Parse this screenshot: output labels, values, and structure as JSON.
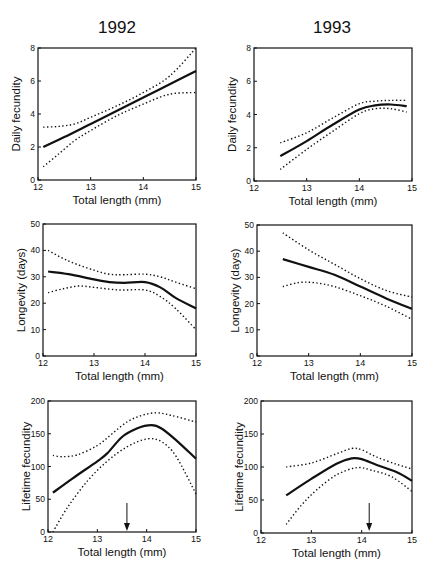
{
  "figure": {
    "column_titles": [
      "1992",
      "1993"
    ],
    "colors": {
      "line": "#111111",
      "background": "#ffffff"
    }
  },
  "chart_data": [
    {
      "id": "daily-fecundity-1992",
      "type": "line",
      "title": "1992",
      "xlabel": "Total length (mm)",
      "ylabel": "Daily fecundity",
      "xlim": [
        12,
        15
      ],
      "ylim": [
        0,
        8
      ],
      "xticks": [
        12,
        13,
        14,
        15
      ],
      "yticks": [
        0,
        2,
        4,
        6,
        8
      ],
      "grid": false,
      "box": {
        "left": 38,
        "top": 48,
        "right": 196,
        "bottom": 180
      },
      "series": [
        {
          "name": "fit",
          "style": "solid",
          "x": [
            12.1,
            12.5,
            13,
            13.5,
            14,
            14.5,
            15
          ],
          "y": [
            2.0,
            2.6,
            3.4,
            4.2,
            5.0,
            5.8,
            6.6
          ]
        },
        {
          "name": "upper CI",
          "style": "dotted",
          "x": [
            12.1,
            12.4,
            12.7,
            13,
            13.5,
            14,
            14.5,
            15
          ],
          "y": [
            3.2,
            3.25,
            3.4,
            3.8,
            4.5,
            5.3,
            6.3,
            8.0
          ]
        },
        {
          "name": "lower CI",
          "style": "dotted",
          "x": [
            12.1,
            12.4,
            12.7,
            13,
            13.5,
            14,
            14.5,
            15
          ],
          "y": [
            0.8,
            1.6,
            2.4,
            3.0,
            3.9,
            4.6,
            5.2,
            5.3
          ]
        }
      ]
    },
    {
      "id": "daily-fecundity-1993",
      "type": "line",
      "title": "1993",
      "xlabel": "Total length (mm)",
      "ylabel": "Daily fecundity",
      "xlim": [
        12,
        15
      ],
      "ylim": [
        0,
        8
      ],
      "xticks": [
        12,
        13,
        14,
        15
      ],
      "yticks": [
        0,
        2,
        4,
        6,
        8
      ],
      "grid": false,
      "box": {
        "left": 254,
        "top": 48,
        "right": 412,
        "bottom": 181
      },
      "series": [
        {
          "name": "fit",
          "style": "solid",
          "x": [
            12.5,
            13,
            13.5,
            14,
            14.3,
            14.6,
            14.9
          ],
          "y": [
            1.5,
            2.4,
            3.4,
            4.3,
            4.55,
            4.6,
            4.5
          ]
        },
        {
          "name": "upper CI",
          "style": "dotted",
          "x": [
            12.5,
            13,
            13.5,
            14,
            14.3,
            14.6,
            14.9
          ],
          "y": [
            2.3,
            2.9,
            3.8,
            4.65,
            4.8,
            4.85,
            4.85
          ]
        },
        {
          "name": "lower CI",
          "style": "dotted",
          "x": [
            12.5,
            13,
            13.5,
            14,
            14.3,
            14.6,
            14.9
          ],
          "y": [
            0.7,
            1.9,
            3.0,
            4.05,
            4.35,
            4.35,
            4.15
          ]
        }
      ]
    },
    {
      "id": "longevity-1992",
      "type": "line",
      "title": "",
      "xlabel": "Total length (mm)",
      "ylabel": "Longevity (days)",
      "xlim": [
        12,
        15
      ],
      "ylim": [
        0,
        50
      ],
      "xticks": [
        12,
        13,
        14,
        15
      ],
      "yticks": [
        0,
        10,
        20,
        30,
        40,
        50
      ],
      "grid": false,
      "box": {
        "left": 43,
        "top": 224,
        "right": 196,
        "bottom": 356
      },
      "series": [
        {
          "name": "fit",
          "style": "solid",
          "x": [
            12.1,
            12.5,
            13,
            13.3,
            13.6,
            14,
            14.3,
            14.6,
            15
          ],
          "y": [
            32,
            31,
            29,
            28,
            27.7,
            28,
            26,
            22,
            18
          ]
        },
        {
          "name": "upper CI",
          "style": "dotted",
          "x": [
            12.1,
            12.5,
            13,
            13.3,
            13.6,
            14,
            14.3,
            14.6,
            15
          ],
          "y": [
            40,
            36,
            32.5,
            31,
            30.8,
            31,
            30,
            28,
            25.5
          ]
        },
        {
          "name": "lower CI",
          "style": "dotted",
          "x": [
            12.1,
            12.4,
            12.7,
            13,
            13.5,
            14,
            14.3,
            14.6,
            15
          ],
          "y": [
            24,
            25.5,
            26.5,
            26,
            25,
            25,
            22.5,
            18,
            10
          ]
        }
      ]
    },
    {
      "id": "longevity-1993",
      "type": "line",
      "title": "",
      "xlabel": "Total length (mm)",
      "ylabel": "Longevity (days)",
      "xlim": [
        12,
        15
      ],
      "ylim": [
        0,
        50
      ],
      "xticks": [
        12,
        13,
        14,
        15
      ],
      "yticks": [
        0,
        10,
        20,
        30,
        40,
        50
      ],
      "grid": false,
      "box": {
        "left": 257,
        "top": 225,
        "right": 412,
        "bottom": 356
      },
      "series": [
        {
          "name": "fit",
          "style": "solid",
          "x": [
            12.5,
            13,
            13.5,
            14,
            14.5,
            15
          ],
          "y": [
            37,
            34,
            31,
            26.5,
            22,
            18
          ]
        },
        {
          "name": "upper CI",
          "style": "dotted",
          "x": [
            12.5,
            13,
            13.5,
            14,
            14.5,
            15
          ],
          "y": [
            47,
            40.5,
            35,
            29.5,
            25,
            22.5
          ]
        },
        {
          "name": "lower CI",
          "style": "dotted",
          "x": [
            12.5,
            12.8,
            13.1,
            13.5,
            14,
            14.5,
            15
          ],
          "y": [
            26.5,
            28,
            28,
            26.5,
            23,
            19,
            14
          ]
        }
      ]
    },
    {
      "id": "lifetime-fecundity-1992",
      "type": "line",
      "title": "",
      "xlabel": "Total length (mm)",
      "ylabel": "Lifetime fecundity",
      "xlim": [
        12,
        15
      ],
      "ylim": [
        0,
        200
      ],
      "xticks": [
        12,
        13,
        14,
        15
      ],
      "yticks": [
        0,
        50,
        100,
        150,
        200
      ],
      "grid": false,
      "box": {
        "left": 48,
        "top": 401,
        "right": 196,
        "bottom": 532
      },
      "annotations": [
        {
          "type": "arrow",
          "x": 13.6,
          "label": "",
          "from_y_px": 503,
          "to_y_px": 532
        }
      ],
      "series": [
        {
          "name": "fit",
          "style": "solid",
          "x": [
            12.1,
            12.5,
            13,
            13.2,
            13.5,
            13.8,
            14.1,
            14.3,
            14.6,
            15
          ],
          "y": [
            60,
            82,
            108,
            120,
            145,
            158,
            163,
            158,
            140,
            112
          ]
        },
        {
          "name": "upper CI",
          "style": "dotted",
          "x": [
            12.1,
            12.3,
            12.6,
            13,
            13.3,
            13.6,
            13.9,
            14.2,
            14.5,
            15
          ],
          "y": [
            117,
            115,
            118,
            132,
            150,
            168,
            178,
            182,
            178,
            168
          ]
        },
        {
          "name": "lower CI",
          "style": "dotted",
          "x": [
            12.1,
            12.4,
            12.8,
            13.2,
            13.6,
            14,
            14.3,
            14.6,
            15
          ],
          "y": [
            0,
            38,
            78,
            108,
            130,
            142,
            138,
            115,
            58
          ]
        }
      ]
    },
    {
      "id": "lifetime-fecundity-1993",
      "type": "line",
      "title": "",
      "xlabel": "Total length (mm)",
      "ylabel": "Lifetime fecundity",
      "xlim": [
        12,
        15
      ],
      "ylim": [
        0,
        200
      ],
      "xticks": [
        12,
        13,
        14,
        15
      ],
      "yticks": [
        0,
        50,
        100,
        150,
        200
      ],
      "grid": false,
      "box": {
        "left": 261,
        "top": 401,
        "right": 412,
        "bottom": 533
      },
      "annotations": [
        {
          "type": "arrow",
          "x": 14.15,
          "label": "",
          "from_y_px": 503,
          "to_y_px": 532
        }
      ],
      "series": [
        {
          "name": "fit",
          "style": "solid",
          "x": [
            12.5,
            13,
            13.5,
            13.8,
            14,
            14.3,
            14.7,
            15
          ],
          "y": [
            57,
            82,
            105,
            113,
            112,
            103,
            92,
            79
          ]
        },
        {
          "name": "upper CI",
          "style": "dotted",
          "x": [
            12.5,
            13,
            13.5,
            13.8,
            14,
            14.3,
            14.7,
            15
          ],
          "y": [
            100,
            106,
            120,
            128,
            126,
            115,
            104,
            97
          ]
        },
        {
          "name": "lower CI",
          "style": "dotted",
          "x": [
            12.5,
            12.8,
            13.1,
            13.5,
            13.9,
            14.2,
            14.6,
            15
          ],
          "y": [
            13,
            42,
            65,
            88,
            99,
            95,
            85,
            63
          ]
        }
      ]
    }
  ]
}
